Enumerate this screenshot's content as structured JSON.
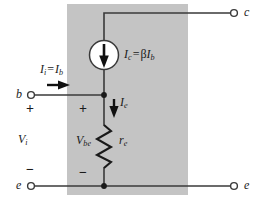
{
  "figure": {
    "kind": "bjt-small-signal-re-model",
    "shaded_block_color": "#c4c4c4",
    "wire_color": "#3a3a3a",
    "text_color": "#1a1a1a",
    "source_fill": "#ffffff"
  },
  "terminals": {
    "base": "b",
    "collector": "c",
    "emitter_left": "e",
    "emitter_right": "e"
  },
  "labels": {
    "input_current": {
      "main": "I",
      "sub1": "i",
      "eq": "=",
      "main2": "I",
      "sub2": "b",
      "text": "Ii = Ib"
    },
    "collector_current": {
      "main": "I",
      "sub1": "c",
      "eq": "=",
      "beta": "β",
      "main2": "I",
      "sub2": "b",
      "text": "Ic = βIb"
    },
    "emitter_current": {
      "main": "I",
      "sub1": "e",
      "text": "Ie"
    },
    "input_voltage": {
      "main": "V",
      "sub1": "i",
      "text": "Vi"
    },
    "base_emitter_voltage": {
      "main": "V",
      "sub1": "be",
      "text": "Vbe"
    },
    "emitter_resistance": {
      "main": "r",
      "sub1": "e",
      "text": "re"
    }
  },
  "polarity": {
    "vi_plus": "+",
    "vi_minus": "−",
    "vbe_plus": "+",
    "vbe_minus": "−"
  },
  "icons": {
    "current_source": "current-source-icon",
    "resistor": "resistor-zigzag-icon",
    "arrow_input": "arrow-right-icon",
    "arrow_emitter": "arrow-down-icon",
    "arrow_source": "arrow-down-icon",
    "node_base": "junction-dot-icon",
    "node_emitter": "junction-dot-icon"
  }
}
